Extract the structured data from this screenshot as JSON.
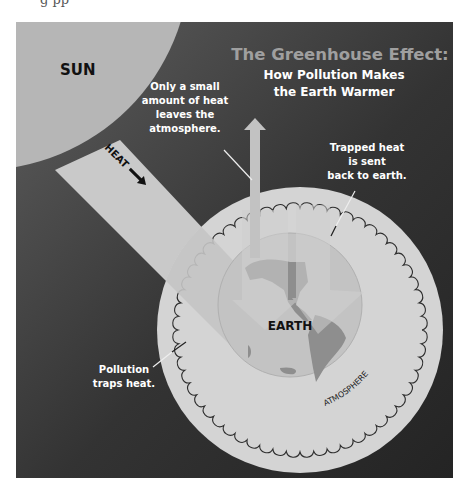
{
  "title": {
    "line1": "The Greenhouse Effect:",
    "line2": "How Pollution Makes",
    "line3": "the Earth Warmer"
  },
  "labels": {
    "sun": "SUN",
    "heat": "HEAT",
    "earth": "EARTH",
    "atmosphere": "ATMOSPHERE",
    "leaves": [
      "Only a small",
      "amount of heat",
      "leaves the",
      "atmosphere."
    ],
    "trapped": [
      "Trapped heat",
      "is sent",
      "back to earth."
    ],
    "pollution": [
      "Pollution",
      "traps heat."
    ]
  },
  "colors": {
    "page": "#ffffff",
    "background_light": "#5a5a5a",
    "background_dark": "#262626",
    "sun": "#b8b8b8",
    "atmosphere": "#d6d6d6",
    "earth": "#c2c2c2",
    "land": "#8c8c8c",
    "beam": "#c8c8c8",
    "title_gray": "#a0a0a0",
    "text_white": "#ffffff",
    "text_black": "#111111"
  }
}
